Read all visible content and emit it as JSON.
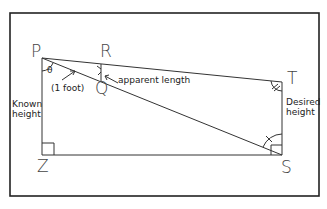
{
  "diagram": {
    "points": {
      "P": {
        "label": "P"
      },
      "R": {
        "label": "R"
      },
      "Q": {
        "label": "Q"
      },
      "T": {
        "label": "T"
      },
      "S": {
        "label": "S"
      },
      "Z": {
        "label": "Z"
      }
    },
    "angle_label": "θ",
    "annotations": {
      "one_foot": "(1 foot)",
      "apparent_length": "apparent length",
      "known_height_line1": "Known",
      "known_height_line2": "height",
      "desired_height_line1": "Desired",
      "desired_height_line2": "height"
    },
    "colors": {
      "line": "#333333",
      "frame": "#222222",
      "background": "#ffffff"
    }
  }
}
